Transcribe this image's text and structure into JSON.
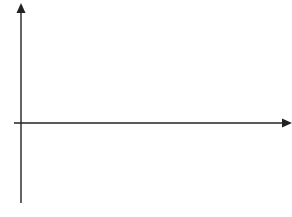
{
  "chart_data": {
    "type": "line",
    "title": "",
    "xlabel": "",
    "ylabel": "",
    "origin_label": "O",
    "x_ticks": [
      "1",
      "2",
      "3",
      "4",
      "5",
      "6",
      "7",
      "8",
      "9"
    ],
    "y_ticks": [
      "4",
      "3",
      "2",
      "1",
      "−1",
      "−2",
      "−3"
    ],
    "xlim": [
      0,
      9
    ],
    "ylim": [
      -3,
      4
    ],
    "grid": true,
    "series": [
      {
        "name": "curve",
        "x": [
          0,
          0.3,
          0.6,
          0.9,
          1.2,
          1.5,
          1.8,
          2.1,
          2.4,
          2.7,
          3.0,
          3.2,
          3.5,
          3.8,
          4.1,
          4.5,
          5.0,
          5.5,
          6.0,
          6.2,
          6.5,
          7.0,
          7.5,
          8.0,
          8.2,
          8.5,
          9.0
        ],
        "y": [
          0,
          1.6,
          2.6,
          2.95,
          3.0,
          2.7,
          1.7,
          0,
          -1.1,
          -1.75,
          -1.98,
          -2.0,
          -1.8,
          -1.1,
          0,
          0.9,
          1.55,
          1.88,
          2.0,
          2.0,
          1.95,
          1.7,
          1.15,
          0.4,
          0,
          -0.8,
          -1.7
        ]
      }
    ],
    "key_points": {
      "max_1": {
        "x": 1.2,
        "y": 3
      },
      "zero_1": {
        "x": 2.1,
        "y": 0
      },
      "min_1": {
        "x": 3.2,
        "y": -2
      },
      "zero_2": {
        "x": 4.1,
        "y": 0
      },
      "max_2": {
        "x": 6.2,
        "y": 2
      },
      "zero_3": {
        "x": 8.2,
        "y": 0
      },
      "end": {
        "x": 9,
        "y": -1.7
      }
    }
  }
}
